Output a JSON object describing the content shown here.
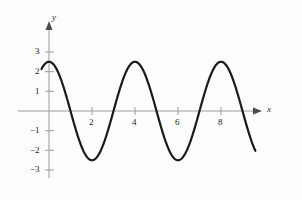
{
  "chart_data": {
    "type": "line",
    "title": "",
    "xlabel": "x",
    "ylabel": "y",
    "function": "y = 2.5 cos(pi x / 2)",
    "amplitude": 2.5,
    "period": 4,
    "xlim": [
      -0.6,
      10.4
    ],
    "ylim": [
      -3.6,
      3.6
    ],
    "x_ticks": [
      2,
      4,
      6,
      8
    ],
    "x_tick_labels": [
      "2",
      "4",
      "6",
      "8"
    ],
    "y_ticks": [
      3,
      2,
      1,
      -1,
      -2,
      -3
    ],
    "y_tick_labels": [
      "3",
      "2",
      "1",
      "−1",
      "−2",
      "−3"
    ],
    "grid": false,
    "legend": null,
    "curve_domain": [
      -0.35,
      9.6
    ],
    "maxima": [
      {
        "x": 0,
        "y": 2.5
      },
      {
        "x": 4,
        "y": 2.5
      },
      {
        "x": 8,
        "y": 2.5
      }
    ],
    "minima": [
      {
        "x": 2,
        "y": -2.5
      },
      {
        "x": 6,
        "y": -2.5
      }
    ],
    "zeros": [
      1,
      3,
      5,
      7,
      9
    ],
    "endpoints": [
      {
        "x": -0.35,
        "y": 2.35
      },
      {
        "x": 9.6,
        "y": -2.0
      }
    ],
    "curve_color": "#1a1a1a",
    "axis_color": "#9a9a9a",
    "background_color": "#fdfdfd"
  },
  "axes": {
    "x_axis_label": "x",
    "y_axis_label": "y"
  }
}
